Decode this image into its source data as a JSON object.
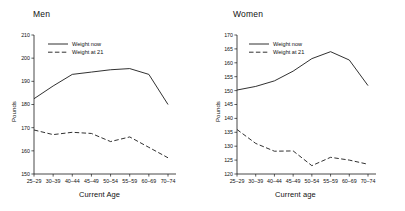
{
  "figure": {
    "panels": [
      {
        "key": "men",
        "title": "Men",
        "xlabel": "Current Age",
        "ylabel": "Pounds",
        "legend": {
          "now_label": "Weight now",
          "at21_label": "Weight at 21"
        }
      },
      {
        "key": "women",
        "title": "Women",
        "xlabel": "Current age",
        "ylabel": "Pounds",
        "legend": {
          "now_label": "Weight now",
          "at21_label": "Weight at 21"
        }
      }
    ]
  },
  "chart_data": [
    {
      "type": "line",
      "title": "Men",
      "xlabel": "Current Age",
      "ylabel": "Pounds",
      "categories": [
        "25-29",
        "30-39",
        "40-44",
        "45-49",
        "50-54",
        "55-59",
        "60-69",
        "70-74"
      ],
      "ylim": [
        150,
        210
      ],
      "yticks": [
        150,
        160,
        170,
        180,
        190,
        200,
        210
      ],
      "grid": false,
      "legend_position": "top-left",
      "series": [
        {
          "name": "Weight now",
          "style": "solid",
          "color": "#1a1a1a",
          "values": [
            182.5,
            188.0,
            193.0,
            194.0,
            195.0,
            195.5,
            193.0,
            180.0
          ]
        },
        {
          "name": "Weight at 21",
          "style": "dashed",
          "color": "#1a1a1a",
          "values": [
            169.0,
            167.0,
            168.0,
            167.5,
            164.0,
            166.0,
            161.5,
            157.0
          ]
        }
      ]
    },
    {
      "type": "line",
      "title": "Women",
      "xlabel": "Current age",
      "ylabel": "Pounds",
      "categories": [
        "25-29",
        "30-39",
        "40-44",
        "45-49",
        "50-54",
        "55-59",
        "60-69",
        "70-74"
      ],
      "ylim": [
        120,
        170
      ],
      "yticks": [
        120,
        125,
        130,
        135,
        140,
        145,
        150,
        155,
        160,
        165,
        170
      ],
      "grid": false,
      "legend_position": "top-left",
      "series": [
        {
          "name": "Weight now",
          "style": "solid",
          "color": "#1a1a1a",
          "values": [
            150.2,
            151.5,
            153.5,
            157.0,
            161.5,
            164.0,
            161.0,
            151.8
          ]
        },
        {
          "name": "Weight at 21",
          "style": "dashed",
          "color": "#1a1a1a",
          "values": [
            136.0,
            131.0,
            128.2,
            128.3,
            123.0,
            126.0,
            125.0,
            123.5
          ]
        }
      ]
    }
  ]
}
